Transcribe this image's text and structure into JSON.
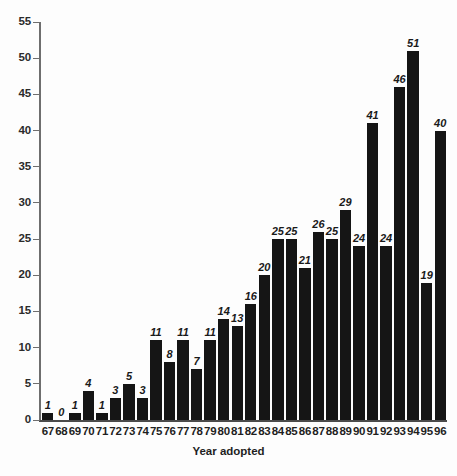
{
  "chart_data": {
    "type": "bar",
    "title": "",
    "subtitle": "",
    "xlabel": "Year adopted",
    "ylabel": "",
    "ylim": [
      0,
      55
    ],
    "ytick_step": 5,
    "yticks": [
      0,
      5,
      10,
      15,
      20,
      25,
      30,
      35,
      40,
      45,
      50,
      55
    ],
    "grid": false,
    "legend": null,
    "bar_color": "#151515",
    "background_color": "#fdfdfd",
    "value_labels_shown": true,
    "categories": [
      "67",
      "68",
      "69",
      "70",
      "71",
      "72",
      "73",
      "74",
      "75",
      "76",
      "77",
      "78",
      "79",
      "80",
      "81",
      "82",
      "83",
      "84",
      "85",
      "86",
      "87",
      "88",
      "89",
      "90",
      "91",
      "92",
      "93",
      "94",
      "95",
      "96"
    ],
    "values": [
      1,
      0,
      1,
      4,
      1,
      3,
      5,
      3,
      11,
      8,
      11,
      7,
      11,
      14,
      13,
      16,
      20,
      25,
      25,
      21,
      26,
      25,
      29,
      24,
      41,
      24,
      46,
      51,
      19,
      40
    ],
    "series": [
      {
        "name": "Count",
        "values": [
          1,
          0,
          1,
          4,
          1,
          3,
          5,
          3,
          11,
          8,
          11,
          7,
          11,
          14,
          13,
          16,
          20,
          25,
          25,
          21,
          26,
          25,
          29,
          24,
          41,
          24,
          46,
          51,
          19,
          40
        ]
      }
    ]
  }
}
